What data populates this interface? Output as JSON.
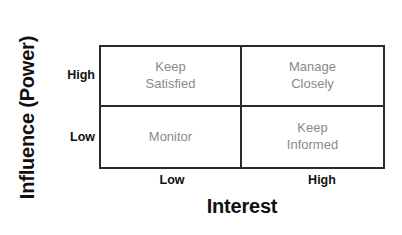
{
  "chart_data": {
    "type": "table",
    "title": "",
    "xlabel": "Interest",
    "ylabel": "Influence (Power)",
    "x_ticks": [
      "Low",
      "High"
    ],
    "y_ticks": [
      "High",
      "Low"
    ],
    "grid": true,
    "legend": "none",
    "colors": {
      "border": "#2b2b2b",
      "cell_text": "#8a8a8a",
      "axis_text": "#111111",
      "background": "#ffffff"
    },
    "categories": [
      "Low Interest",
      "High Interest"
    ],
    "rows": [
      {
        "y_level": "High",
        "cells": [
          {
            "x_level": "Low",
            "label": "Keep\nSatisfied"
          },
          {
            "x_level": "High",
            "label": "Manage\nClosely"
          }
        ]
      },
      {
        "y_level": "Low",
        "cells": [
          {
            "x_level": "Low",
            "label": "Monitor"
          },
          {
            "x_level": "High",
            "label": "Keep\nInformed"
          }
        ]
      }
    ]
  },
  "axes": {
    "y_title": "Influence (Power)",
    "x_title": "Interest",
    "y_high": "High",
    "y_low": "Low",
    "x_low": "Low",
    "x_high": "High"
  },
  "quadrants": {
    "top_left": "Keep\nSatisfied",
    "top_right": "Manage\nClosely",
    "bottom_left": "Monitor",
    "bottom_right": "Keep\nInformed"
  }
}
